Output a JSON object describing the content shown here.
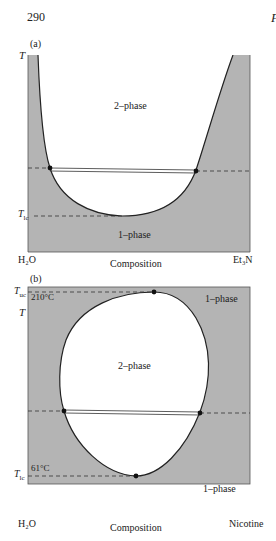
{
  "page": {
    "number": "290",
    "running_head_fragment": "P"
  },
  "figure": {
    "panels": [
      {
        "label": "(a)",
        "axis_y": "T",
        "axis_x": "Composition",
        "left_component": "H₂O",
        "right_component": "Et₃N",
        "region_labels": {
          "upper": "2–phase",
          "lower": "1–phase"
        },
        "critical_label": "T",
        "critical_sub": "lc",
        "critical_type": "lower critical solution temperature"
      },
      {
        "label": "(b)",
        "axis_y": "T",
        "axis_x": "Composition",
        "left_component": "H₂O",
        "right_component": "Nicotine",
        "region_labels": {
          "inner": "2–phase",
          "upper_right": "1–phase",
          "lower_right": "1–phase"
        },
        "upper_critical_label": "T",
        "upper_critical_sub": "uc",
        "upper_critical_temp": "210°C",
        "lower_critical_label": "T",
        "lower_critical_sub": "lc",
        "lower_critical_temp": "61°C"
      }
    ],
    "colors": {
      "shaded": "#b4b4b4",
      "line": "#222222",
      "background": "#ffffff"
    }
  }
}
